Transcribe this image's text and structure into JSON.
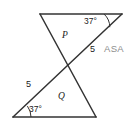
{
  "figure": {
    "background_color": "#ffffff",
    "stroke_color": "#333333",
    "text_color": "#1a1a1a",
    "method_color": "#8d8d8d"
  },
  "labels": {
    "angle_top_right": "37°",
    "angle_bottom_left": "37°",
    "side_upper": "5",
    "side_lower": "5",
    "region_upper": "P",
    "region_lower": "Q",
    "congruence_method": "ASA"
  },
  "geometry": {
    "top_left_vertex": [
      40,
      14
    ],
    "top_right_vertex": [
      122,
      14
    ],
    "bottom_left_vertex": [
      13,
      117
    ],
    "bottom_right_vertex": [
      96,
      117
    ],
    "crossing_point": [
      68,
      67
    ],
    "transversal_start": [
      13,
      117
    ],
    "transversal_end": [
      122,
      14
    ]
  }
}
